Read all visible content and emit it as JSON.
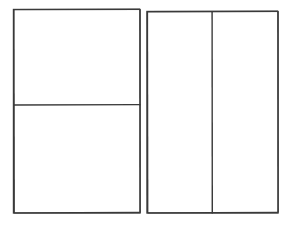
{
  "canvas": {
    "width": 292,
    "height": 226,
    "background_color": "#ffffff",
    "stroke_color": "#3a3a3a",
    "stroke_color_light": "#555555",
    "stroke_width": 1.4,
    "description": "Line-drawing wireframe of two outlined containers subdivided into four blank panels"
  },
  "groups": [
    {
      "id": "left-container",
      "name": "left-container",
      "x": 13.5,
      "y": 9.5,
      "width": 126.5,
      "height": 203.5,
      "orientation": "vertical-split",
      "dividers": [
        {
          "id": "left-horizontal-divider",
          "axis": "horizontal",
          "position": 105.0
        }
      ],
      "panels": [
        {
          "id": "left-top-panel",
          "name": "left-top-panel",
          "x": 13.5,
          "y": 9.5,
          "width": 126.5,
          "height": 95.5,
          "label": "",
          "fill": "#ffffff"
        },
        {
          "id": "left-bottom-panel",
          "name": "left-bottom-panel",
          "x": 13.5,
          "y": 105.0,
          "width": 126.5,
          "height": 108.0,
          "label": "",
          "fill": "#ffffff"
        }
      ]
    },
    {
      "id": "right-container",
      "name": "right-container",
      "x": 147.0,
      "y": 11.5,
      "width": 131.0,
      "height": 201.5,
      "orientation": "horizontal-split",
      "dividers": [
        {
          "id": "right-vertical-divider",
          "axis": "vertical",
          "position": 212.0
        }
      ],
      "panels": [
        {
          "id": "right-left-panel",
          "name": "right-left-panel",
          "x": 147.0,
          "y": 11.5,
          "width": 65.0,
          "height": 201.5,
          "label": "",
          "fill": "#ffffff"
        },
        {
          "id": "right-right-panel",
          "name": "right-right-panel",
          "x": 212.0,
          "y": 11.5,
          "width": 66.0,
          "height": 201.5,
          "label": "",
          "fill": "#ffffff"
        }
      ]
    }
  ],
  "gap": {
    "between_containers_px": 7
  }
}
